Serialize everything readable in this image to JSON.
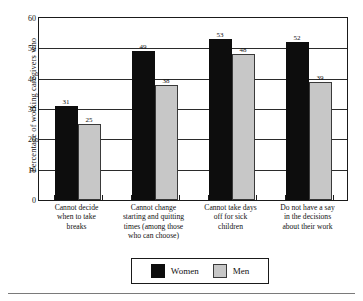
{
  "chart_data": {
    "type": "bar",
    "title": "",
    "subtitle": "",
    "xlabel": "",
    "ylabel": "Percentage of working caregivers who",
    "ylim": [
      0,
      60
    ],
    "ytick_labels": [
      "0",
      "10",
      "20",
      "30",
      "40",
      "50",
      "60"
    ],
    "ytick_values": [
      0,
      10,
      20,
      30,
      40,
      50,
      60
    ],
    "grid": true,
    "legend_position": "bottom",
    "categories": [
      "Cannot decide when to take breaks",
      "Cannot change starting and quitting times (among those who can choose)",
      "Cannot take days off for sick children",
      "Do not have a say in the decisions about their work"
    ],
    "category_lines": [
      [
        "Cannot decide",
        "when to take",
        "breaks"
      ],
      [
        "Cannot change",
        "starting and quitting",
        "times (among those",
        "who can choose)"
      ],
      [
        "Cannot take days",
        "off for sick",
        "children"
      ],
      [
        "Do not have a say",
        "in the decisions",
        "about their work"
      ]
    ],
    "series": [
      {
        "name": "Women",
        "color": "#0d0d0d",
        "values": [
          31,
          49,
          53,
          52
        ],
        "labels": [
          "31",
          "49",
          "53",
          "52"
        ]
      },
      {
        "name": "Men",
        "color": "#c7c7c7",
        "values": [
          25,
          38,
          48,
          39
        ],
        "labels": [
          "25",
          "38",
          "48",
          "39"
        ]
      }
    ]
  },
  "legend": {
    "items": [
      {
        "label": "Women",
        "swatch": "black-square-swatch"
      },
      {
        "label": "Men",
        "swatch": "gray-square-swatch"
      }
    ]
  }
}
